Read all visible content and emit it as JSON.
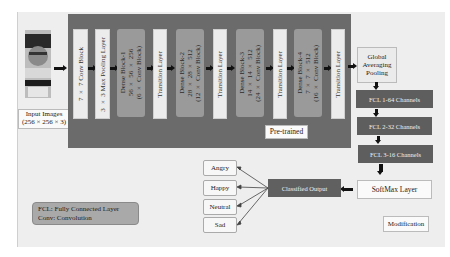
{
  "input": {
    "label_line1": "Input Images",
    "label_line2": "(256 × 256 × 3)"
  },
  "pretrained": {
    "label": "Pre-trained",
    "blocks": [
      {
        "type": "conv",
        "text": "7 × 7 Conv Block"
      },
      {
        "type": "pool",
        "text": "3 × 3 Max Pooling Layer"
      },
      {
        "type": "dense",
        "text": "Dense Block-1\n56 × 56 × 256\n(6 × Conv Block)"
      },
      {
        "type": "transition",
        "text": "Transition Layer"
      },
      {
        "type": "dense",
        "text": "Dense Block-2\n28 × 28 × 512\n(12 × Conv Block)"
      },
      {
        "type": "transition",
        "text": "Transition Layer"
      },
      {
        "type": "dense",
        "text": "Dense Block-3\n14 × 14 × 512\n(24 × Conv Block)"
      },
      {
        "type": "transition",
        "text": "Transition Layer"
      },
      {
        "type": "dense",
        "text": "Dense Block-4\n7 × 7 × 512\n(16 × Conv Block)"
      },
      {
        "type": "transition",
        "text": "Transition Layer"
      }
    ]
  },
  "modification": {
    "label": "Modification",
    "gap": "Global Averaging Pooling",
    "fcl1": "FCL 1-64 Channels",
    "fcl2": "FCL 2-32 Channels",
    "fcl3": "FCL 3-16 Channels",
    "softmax": "SoftMax Layer",
    "classified": "Classified Output"
  },
  "outputs": [
    "Angry",
    "Happy",
    "Neutral",
    "Sad"
  ],
  "legend": {
    "line1": "FCL: Fully Connected Layer",
    "line2": "Conv: Convolution"
  },
  "colors": {
    "pretrained_bg": "#6b6b6b",
    "dense_block": "#9a9a9a",
    "fcl_box": "#5e5e5e",
    "frame_bg": "#eeeeee"
  }
}
